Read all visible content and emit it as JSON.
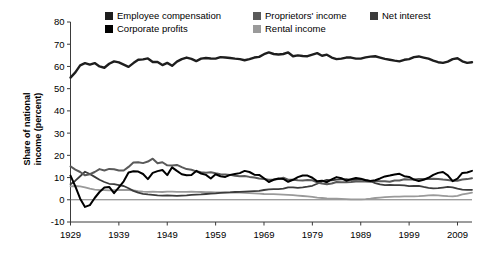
{
  "chart_data": {
    "type": "line",
    "title": "",
    "xlabel": "",
    "ylabel": "Share of national income (percent)",
    "ylabel_line1": "Share of national",
    "ylabel_line2": "income (percent)",
    "grid": false,
    "legend_position": "top",
    "xlim": [
      1929,
      2012
    ],
    "ylim": [
      -10,
      80
    ],
    "yticks": [
      -10,
      0,
      10,
      20,
      30,
      40,
      50,
      60,
      70,
      80
    ],
    "ytick_labels": [
      "-10",
      "0",
      "10",
      "20",
      "30",
      "40",
      "50",
      "60",
      "70",
      "80"
    ],
    "xticks": [
      1929,
      1939,
      1949,
      1959,
      1969,
      1979,
      1989,
      1999,
      2009
    ],
    "xtick_labels": [
      "1929",
      "1939",
      "1949",
      "1959",
      "1969",
      "1979",
      "1989",
      "1999",
      "2009"
    ],
    "x": [
      1929,
      1930,
      1931,
      1932,
      1933,
      1934,
      1935,
      1936,
      1937,
      1938,
      1939,
      1940,
      1941,
      1942,
      1943,
      1944,
      1945,
      1946,
      1947,
      1948,
      1949,
      1950,
      1951,
      1952,
      1953,
      1954,
      1955,
      1956,
      1957,
      1958,
      1959,
      1960,
      1961,
      1962,
      1963,
      1964,
      1965,
      1966,
      1967,
      1968,
      1969,
      1970,
      1971,
      1972,
      1973,
      1974,
      1975,
      1976,
      1977,
      1978,
      1979,
      1980,
      1981,
      1982,
      1983,
      1984,
      1985,
      1986,
      1987,
      1988,
      1989,
      1990,
      1991,
      1992,
      1993,
      1994,
      1995,
      1996,
      1997,
      1998,
      1999,
      2000,
      2001,
      2002,
      2003,
      2004,
      2005,
      2006,
      2007,
      2008,
      2009,
      2010,
      2011,
      2012
    ],
    "series": [
      {
        "name": "Employee compensation",
        "color": "#1e1e1e",
        "width": 2.4,
        "values": [
          55.0,
          57.3,
          60.5,
          61.5,
          60.8,
          61.5,
          60.0,
          59.4,
          61.2,
          62.3,
          61.8,
          60.8,
          59.8,
          61.5,
          63.0,
          63.2,
          63.6,
          62.0,
          62.0,
          60.6,
          61.6,
          60.3,
          62.2,
          63.3,
          64.0,
          63.4,
          62.4,
          63.5,
          63.8,
          63.6,
          63.5,
          64.2,
          64.0,
          63.8,
          63.5,
          63.3,
          62.8,
          63.3,
          64.0,
          64.3,
          65.5,
          66.3,
          65.6,
          65.4,
          65.6,
          66.3,
          64.6,
          65.0,
          64.7,
          64.6,
          65.3,
          66.0,
          64.8,
          65.3,
          64.0,
          63.3,
          63.5,
          64.0,
          64.0,
          63.5,
          63.5,
          64.1,
          64.4,
          64.6,
          64.0,
          63.4,
          63.0,
          62.6,
          62.3,
          63.0,
          63.3,
          64.2,
          64.5,
          64.0,
          63.5,
          62.6,
          61.9,
          61.6,
          62.2,
          63.3,
          63.7,
          62.3,
          61.6,
          61.9
        ]
      },
      {
        "name": "Corporate profits",
        "color": "#000000",
        "width": 2.0,
        "values": [
          10.9,
          6.0,
          0.5,
          -3.2,
          -2.4,
          0.8,
          3.5,
          5.5,
          5.8,
          3.0,
          5.6,
          8.3,
          12.3,
          12.8,
          12.7,
          11.6,
          9.3,
          12.1,
          12.9,
          13.4,
          11.1,
          14.6,
          13.0,
          11.5,
          11.0,
          11.1,
          13.0,
          11.8,
          11.2,
          9.6,
          11.5,
          10.6,
          10.3,
          11.2,
          11.6,
          12.0,
          13.0,
          12.5,
          11.3,
          11.2,
          9.7,
          8.0,
          9.0,
          9.6,
          9.4,
          8.1,
          9.0,
          10.2,
          10.9,
          10.9,
          9.9,
          8.3,
          8.6,
          7.9,
          9.2,
          10.2,
          9.7,
          8.6,
          9.2,
          9.8,
          9.5,
          8.8,
          8.5,
          8.8,
          9.6,
          10.5,
          10.9,
          11.4,
          11.7,
          10.6,
          10.3,
          9.1,
          8.4,
          9.0,
          9.9,
          11.2,
          12.1,
          12.5,
          11.0,
          8.4,
          9.5,
          12.1,
          12.3,
          13.0
        ]
      },
      {
        "name": "Proprietors' income",
        "color": "#5a5a5a",
        "width": 2.0,
        "values": [
          15.0,
          13.6,
          12.5,
          11.0,
          11.5,
          12.5,
          13.8,
          13.2,
          13.9,
          13.7,
          13.2,
          13.2,
          14.8,
          16.8,
          16.9,
          16.5,
          17.2,
          18.5,
          16.4,
          16.9,
          15.5,
          15.4,
          15.7,
          14.7,
          13.8,
          13.5,
          12.8,
          12.4,
          12.2,
          12.4,
          11.9,
          11.5,
          11.4,
          11.2,
          10.8,
          10.6,
          10.7,
          10.3,
          10.0,
          9.6,
          9.3,
          9.0,
          9.1,
          9.3,
          9.9,
          9.0,
          9.0,
          8.8,
          8.7,
          8.9,
          8.8,
          7.8,
          7.3,
          7.0,
          7.3,
          8.0,
          7.9,
          7.9,
          8.0,
          8.2,
          8.3,
          8.2,
          8.1,
          8.5,
          8.3,
          8.3,
          8.1,
          8.7,
          8.7,
          9.2,
          9.1,
          9.1,
          9.4,
          9.3,
          9.3,
          9.5,
          9.4,
          9.1,
          8.9,
          8.6,
          8.6,
          9.1,
          9.3,
          9.7
        ]
      },
      {
        "name": "Net interest",
        "color": "#3c3c3c",
        "width": 1.8,
        "values": [
          7.0,
          8.6,
          10.6,
          12.6,
          11.6,
          10.3,
          9.0,
          8.0,
          7.2,
          7.0,
          6.6,
          6.2,
          5.2,
          4.0,
          3.2,
          2.7,
          2.4,
          2.2,
          2.0,
          1.9,
          2.0,
          1.9,
          1.8,
          1.9,
          2.0,
          2.2,
          2.3,
          2.4,
          2.6,
          2.8,
          2.9,
          3.1,
          3.2,
          3.3,
          3.5,
          3.6,
          3.7,
          3.8,
          3.9,
          4.0,
          4.4,
          4.7,
          4.8,
          4.8,
          5.0,
          5.6,
          5.6,
          5.4,
          5.6,
          5.9,
          6.3,
          7.2,
          8.3,
          9.0,
          8.7,
          9.1,
          9.2,
          9.3,
          9.0,
          9.0,
          9.2,
          8.9,
          8.4,
          7.5,
          6.9,
          6.6,
          6.7,
          6.6,
          6.6,
          6.5,
          6.1,
          6.2,
          6.3,
          5.8,
          5.4,
          5.1,
          5.2,
          5.5,
          5.8,
          5.6,
          5.0,
          4.6,
          4.5,
          4.5
        ]
      },
      {
        "name": "Rental income",
        "color": "#9a9a9a",
        "width": 1.8,
        "values": [
          6.0,
          6.2,
          6.0,
          5.6,
          5.0,
          4.6,
          4.4,
          4.3,
          4.2,
          4.3,
          4.4,
          4.4,
          4.4,
          4.2,
          3.9,
          3.7,
          3.6,
          3.7,
          3.6,
          3.5,
          3.7,
          3.7,
          3.6,
          3.6,
          3.6,
          3.7,
          3.6,
          3.5,
          3.4,
          3.4,
          3.3,
          3.3,
          3.3,
          3.3,
          3.2,
          3.2,
          3.1,
          3.0,
          2.9,
          2.8,
          2.6,
          2.5,
          2.5,
          2.4,
          2.3,
          2.2,
          2.1,
          1.9,
          1.7,
          1.5,
          1.3,
          1.0,
          0.8,
          0.6,
          0.5,
          0.5,
          0.4,
          0.3,
          0.2,
          0.2,
          0.2,
          0.3,
          0.5,
          0.8,
          1.0,
          1.2,
          1.3,
          1.4,
          1.4,
          1.5,
          1.5,
          1.5,
          1.6,
          1.8,
          2.0,
          2.1,
          2.0,
          1.8,
          1.6,
          1.5,
          1.8,
          2.4,
          2.8,
          3.2
        ]
      }
    ],
    "legend": [
      {
        "label": "Employee compensation",
        "color": "#1e1e1e",
        "row": 0,
        "col": 0
      },
      {
        "label": "Proprietors' income",
        "color": "#5a5a5a",
        "row": 0,
        "col": 1
      },
      {
        "label": "Net interest",
        "color": "#3c3c3c",
        "row": 0,
        "col": 2
      },
      {
        "label": "Corporate profits",
        "color": "#000000",
        "row": 1,
        "col": 0
      },
      {
        "label": "Rental income",
        "color": "#9a9a9a",
        "row": 1,
        "col": 1
      }
    ]
  }
}
